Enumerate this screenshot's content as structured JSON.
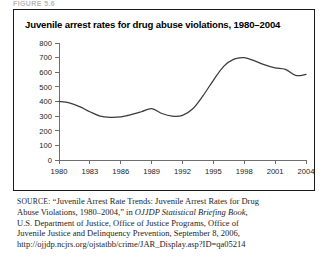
{
  "top_caption": "FIGURE 5.6",
  "figure": {
    "title": "Juvenile arrest rates for drug abuse violations, 1980–2004"
  },
  "source": {
    "label": "SOURCE:",
    "line1_rest": " “Juvenile Arrest Rate Trends: Juvenile Arrest Rates for Drug",
    "line2_a": "Abuse Violations, 1980–2004,” in ",
    "line2_italic": "OJJDP Statistical Briefing Book,",
    "line3": "U.S. Department of Justice, Office of Justice Programs, Office of",
    "line4": "Juvenile Justice and Delinquency Prevention, September 8, 2006,",
    "line5": "http://ojjdp.ncjrs.org/ojstatbb/crime/JAR_Display.asp?ID=qa05214"
  },
  "chart_data": {
    "type": "line",
    "title": "Juvenile arrest rates for drug abuse violations, 1980–2004",
    "xlabel": "",
    "ylabel": "",
    "xlim": [
      1980,
      2004
    ],
    "ylim": [
      0,
      800
    ],
    "grid": false,
    "legend": "none",
    "line_color": "#3b3b3b",
    "ytick_labels": [
      "0",
      "100",
      "200",
      "300",
      "400",
      "500",
      "600",
      "700",
      "800"
    ],
    "ytick_values": [
      0,
      100,
      200,
      300,
      400,
      500,
      600,
      700,
      800
    ],
    "xtick_labels": [
      "1980",
      "1983",
      "1986",
      "1989",
      "1992",
      "1995",
      "1998",
      "2001",
      "2004"
    ],
    "xtick_values": [
      1980,
      1983,
      1986,
      1989,
      1992,
      1995,
      1998,
      2001,
      2004
    ],
    "x": [
      1980,
      1981,
      1982,
      1983,
      1984,
      1985,
      1986,
      1987,
      1988,
      1989,
      1990,
      1991,
      1992,
      1993,
      1994,
      1995,
      1996,
      1997,
      1998,
      1999,
      2000,
      2001,
      2002,
      2003,
      2004
    ],
    "values": [
      400,
      390,
      365,
      330,
      300,
      292,
      295,
      310,
      330,
      352,
      318,
      300,
      305,
      350,
      440,
      545,
      640,
      690,
      700,
      678,
      650,
      630,
      620,
      578,
      585
    ],
    "series": [
      {
        "name": "Juvenile arrest rate (per 100,000)",
        "values": [
          400,
          390,
          365,
          330,
          300,
          292,
          295,
          310,
          330,
          352,
          318,
          300,
          305,
          350,
          440,
          545,
          640,
          690,
          700,
          678,
          650,
          630,
          620,
          578,
          585
        ]
      }
    ]
  }
}
